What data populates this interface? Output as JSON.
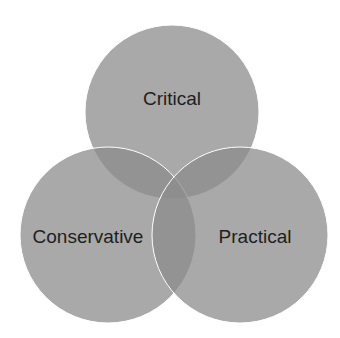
{
  "diagram": {
    "type": "venn",
    "sets": [
      {
        "label": "Critical",
        "cx": 172,
        "cy": 112,
        "r": 87
      },
      {
        "label": "Conservative",
        "cx": 108,
        "cy": 235,
        "r": 88
      },
      {
        "label": "Practical",
        "cx": 240,
        "cy": 235,
        "r": 88
      }
    ],
    "colors": {
      "fill": "#8c8c8c",
      "stroke": "#ffffff",
      "text": "#1e1e1e",
      "background": "#ffffff"
    }
  }
}
